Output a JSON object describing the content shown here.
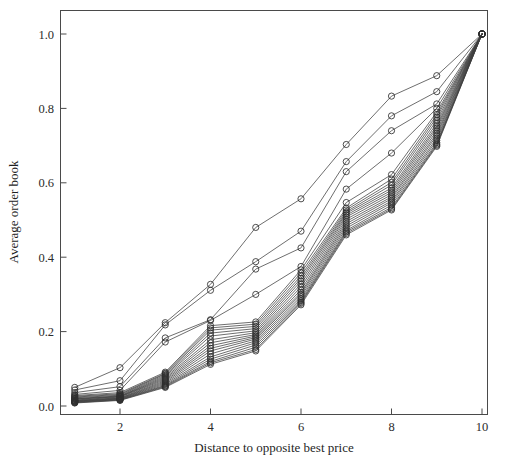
{
  "chart_data": {
    "type": "line",
    "title": "",
    "subtitle": "",
    "xlabel": "Distance to opposite best price",
    "ylabel": "Average order book",
    "xlim": [
      0.6,
      10.4
    ],
    "ylim": [
      -0.035,
      1.045
    ],
    "xticks": [
      2,
      4,
      6,
      8,
      10
    ],
    "xtick_labels": [
      "2",
      "4",
      "6",
      "8",
      "10"
    ],
    "yticks": [
      0.0,
      0.2,
      0.4,
      0.6,
      0.8,
      1.0
    ],
    "ytick_labels": [
      "0.0",
      "0.2",
      "0.4",
      "0.6",
      "0.8",
      "1.0"
    ],
    "grid": false,
    "legend": false,
    "legend_position": "none",
    "marker": "circle-open",
    "marker_size": 3.1,
    "line_color": "#3d3d3d",
    "marker_color": "#2e2e2e",
    "x": [
      1,
      2,
      3,
      4,
      5,
      6,
      7,
      8,
      9,
      10
    ],
    "series": [
      {
        "name": "series-01",
        "values": [
          0.05,
          0.103,
          0.224,
          0.327,
          0.48,
          0.557,
          0.703,
          0.833,
          0.888,
          1.0
        ]
      },
      {
        "name": "series-02",
        "values": [
          0.043,
          0.068,
          0.218,
          0.311,
          0.388,
          0.47,
          0.657,
          0.78,
          0.845,
          1.0
        ]
      },
      {
        "name": "series-03",
        "values": [
          0.036,
          0.052,
          0.183,
          0.232,
          0.368,
          0.425,
          0.63,
          0.74,
          0.812,
          1.0
        ]
      },
      {
        "name": "series-04",
        "values": [
          0.031,
          0.042,
          0.172,
          0.23,
          0.3,
          0.375,
          0.583,
          0.68,
          0.8,
          1.0
        ]
      },
      {
        "name": "series-05",
        "values": [
          0.028,
          0.036,
          0.091,
          0.216,
          0.226,
          0.366,
          0.547,
          0.622,
          0.79,
          1.0
        ]
      },
      {
        "name": "series-06",
        "values": [
          0.026,
          0.033,
          0.088,
          0.21,
          0.22,
          0.358,
          0.532,
          0.61,
          0.783,
          1.0
        ]
      },
      {
        "name": "series-07",
        "values": [
          0.024,
          0.031,
          0.086,
          0.204,
          0.214,
          0.35,
          0.527,
          0.601,
          0.776,
          1.0
        ]
      },
      {
        "name": "series-08",
        "values": [
          0.022,
          0.029,
          0.083,
          0.196,
          0.208,
          0.343,
          0.522,
          0.594,
          0.768,
          1.0
        ]
      },
      {
        "name": "series-09",
        "values": [
          0.02,
          0.027,
          0.08,
          0.188,
          0.202,
          0.336,
          0.518,
          0.586,
          0.76,
          1.0
        ]
      },
      {
        "name": "series-10",
        "values": [
          0.019,
          0.026,
          0.077,
          0.178,
          0.197,
          0.328,
          0.513,
          0.58,
          0.753,
          1.0
        ]
      },
      {
        "name": "series-11",
        "values": [
          0.018,
          0.025,
          0.074,
          0.17,
          0.192,
          0.32,
          0.508,
          0.574,
          0.747,
          1.0
        ]
      },
      {
        "name": "series-12",
        "values": [
          0.016,
          0.024,
          0.071,
          0.162,
          0.188,
          0.312,
          0.502,
          0.568,
          0.74,
          1.0
        ]
      },
      {
        "name": "series-13",
        "values": [
          0.015,
          0.022,
          0.068,
          0.155,
          0.184,
          0.305,
          0.496,
          0.562,
          0.733,
          1.0
        ]
      },
      {
        "name": "series-14",
        "values": [
          0.014,
          0.021,
          0.065,
          0.148,
          0.18,
          0.3,
          0.49,
          0.557,
          0.727,
          1.0
        ]
      },
      {
        "name": "series-15",
        "values": [
          0.013,
          0.02,
          0.062,
          0.14,
          0.175,
          0.294,
          0.484,
          0.551,
          0.72,
          1.0
        ]
      },
      {
        "name": "series-16",
        "values": [
          0.012,
          0.019,
          0.059,
          0.132,
          0.17,
          0.288,
          0.478,
          0.546,
          0.714,
          1.0
        ]
      },
      {
        "name": "series-17",
        "values": [
          0.011,
          0.018,
          0.056,
          0.126,
          0.164,
          0.283,
          0.472,
          0.54,
          0.708,
          1.0
        ]
      },
      {
        "name": "series-18",
        "values": [
          0.01,
          0.017,
          0.054,
          0.12,
          0.158,
          0.279,
          0.468,
          0.534,
          0.704,
          1.0
        ]
      },
      {
        "name": "series-19",
        "values": [
          0.009,
          0.016,
          0.052,
          0.116,
          0.152,
          0.276,
          0.464,
          0.53,
          0.701,
          1.0
        ]
      },
      {
        "name": "series-20",
        "values": [
          0.008,
          0.015,
          0.05,
          0.112,
          0.148,
          0.272,
          0.46,
          0.527,
          0.698,
          1.0
        ]
      }
    ]
  },
  "figure": {
    "axis_color": "#4a4a4a",
    "background": "#ffffff"
  }
}
